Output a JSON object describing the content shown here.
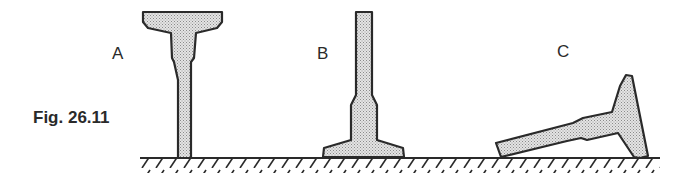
{
  "figure": {
    "caption": "Fig. 26.11",
    "labels": {
      "a": "A",
      "b": "B",
      "c": "C"
    },
    "colors": {
      "outline": "#2a2a2a",
      "fill": "#d8d8d8",
      "stipple": "#8a8a8a",
      "background": "#ffffff"
    },
    "objects": [
      {
        "id": "A",
        "description": "T-shaped object standing upright on its narrow stem, wide head on top"
      },
      {
        "id": "B",
        "description": "T-shaped object standing upright on its wide base, narrow stem pointing up"
      },
      {
        "id": "C",
        "description": "T-shaped object lying tilted, head resting on ground at right, stem end touching ground at left"
      }
    ],
    "ground": "hatched horizontal surface"
  }
}
